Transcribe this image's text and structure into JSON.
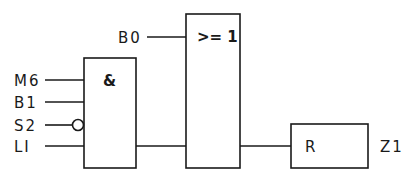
{
  "diagram": {
    "type": "logic-function-block-diagram",
    "and_gate": {
      "symbol": "&",
      "inputs": [
        {
          "label": "M6",
          "negated": false
        },
        {
          "label": "B1",
          "negated": false
        },
        {
          "label": "S2",
          "negated": true
        },
        {
          "label": "LI",
          "negated": false
        }
      ]
    },
    "or_gate": {
      "symbol": ">= 1",
      "inputs": [
        {
          "label": "B0"
        },
        {
          "label": "AND output"
        }
      ]
    },
    "reset_block": {
      "symbol": "R",
      "output_label": "Z1"
    }
  }
}
